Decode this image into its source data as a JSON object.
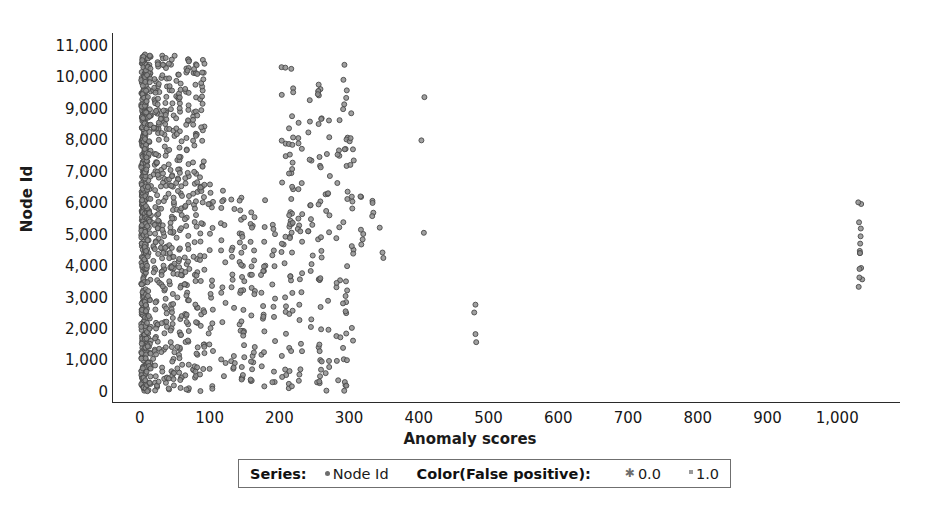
{
  "chart_data": {
    "type": "scatter",
    "title": "",
    "xlabel": "Anomaly scores",
    "ylabel": "Node Id",
    "xlim": [
      -40,
      1090
    ],
    "ylim": [
      -350,
      11400
    ],
    "grid": false,
    "x_ticks": [
      0,
      100,
      200,
      300,
      400,
      500,
      600,
      700,
      800,
      900,
      1000
    ],
    "x_tick_labels": [
      "0",
      "100",
      "200",
      "300",
      "400",
      "500",
      "600",
      "700",
      "800",
      "900",
      "1,000"
    ],
    "y_ticks": [
      0,
      1000,
      2000,
      3000,
      4000,
      5000,
      6000,
      7000,
      8000,
      9000,
      10000,
      11000
    ],
    "y_tick_labels": [
      "0",
      "1,000",
      "2,000",
      "3,000",
      "4,000",
      "5,000",
      "6,000",
      "7,000",
      "8,000",
      "9,000",
      "10,000",
      "11,000"
    ],
    "marker": {
      "shape": "circle",
      "size_px": 5,
      "fill": "#8f8f8f",
      "stroke": "#4a4a4a",
      "opacity": 0.85
    },
    "series": [
      {
        "name": "Node Id",
        "color": "#6d6d6d",
        "description": "Anomaly score per node id; scores are quantized into narrow vertical bands. A dominant dense band sits at scores 0-12 covering the entire node id range, with progressively sparser bands near 25, 40, 55, 70, 85, 145, 160, 215, 255, 290, 300, 345, 405, 480 and an outlier cluster near 1030."
      }
    ],
    "bands": [
      {
        "x_center": 4,
        "weight": 430,
        "y_min": 0,
        "y_max": 10750
      },
      {
        "x_center": 10,
        "weight": 160,
        "y_min": 0,
        "y_max": 10700
      },
      {
        "x_center": 22,
        "weight": 95,
        "y_min": 0,
        "y_max": 10700
      },
      {
        "x_center": 33,
        "weight": 80,
        "y_min": 200,
        "y_max": 10700
      },
      {
        "x_center": 44,
        "weight": 75,
        "y_min": 0,
        "y_max": 10720
      },
      {
        "x_center": 55,
        "weight": 70,
        "y_min": 0,
        "y_max": 10700
      },
      {
        "x_center": 66,
        "weight": 60,
        "y_min": 0,
        "y_max": 10700
      },
      {
        "x_center": 78,
        "weight": 55,
        "y_min": 0,
        "y_max": 10680
      },
      {
        "x_center": 88,
        "weight": 48,
        "y_min": 0,
        "y_max": 10650
      },
      {
        "x_center": 100,
        "weight": 22,
        "y_min": 0,
        "y_max": 6600
      },
      {
        "x_center": 118,
        "weight": 16,
        "y_min": 0,
        "y_max": 6400
      },
      {
        "x_center": 132,
        "weight": 14,
        "y_min": 0,
        "y_max": 6200
      },
      {
        "x_center": 145,
        "weight": 34,
        "y_min": 0,
        "y_max": 6300
      },
      {
        "x_center": 160,
        "weight": 24,
        "y_min": 0,
        "y_max": 6200
      },
      {
        "x_center": 175,
        "weight": 18,
        "y_min": 0,
        "y_max": 6100
      },
      {
        "x_center": 190,
        "weight": 14,
        "y_min": 300,
        "y_max": 6000
      },
      {
        "x_center": 205,
        "weight": 20,
        "y_min": 0,
        "y_max": 10400
      },
      {
        "x_center": 215,
        "weight": 40,
        "y_min": 0,
        "y_max": 10450
      },
      {
        "x_center": 228,
        "weight": 22,
        "y_min": 0,
        "y_max": 9800
      },
      {
        "x_center": 243,
        "weight": 16,
        "y_min": 0,
        "y_max": 9400
      },
      {
        "x_center": 256,
        "weight": 34,
        "y_min": 0,
        "y_max": 10100
      },
      {
        "x_center": 268,
        "weight": 16,
        "y_min": 0,
        "y_max": 9000
      },
      {
        "x_center": 283,
        "weight": 14,
        "y_min": 0,
        "y_max": 9600
      },
      {
        "x_center": 293,
        "weight": 30,
        "y_min": 0,
        "y_max": 10500
      },
      {
        "x_center": 302,
        "weight": 14,
        "y_min": 0,
        "y_max": 9200
      },
      {
        "x_center": 318,
        "weight": 6,
        "y_min": 3400,
        "y_max": 6500
      },
      {
        "x_center": 333,
        "weight": 4,
        "y_min": 5400,
        "y_max": 6100
      },
      {
        "x_center": 345,
        "weight": 3,
        "y_min": 3900,
        "y_max": 5600
      },
      {
        "x_center": 405,
        "weight": 3,
        "y_min": 4600,
        "y_max": 10100
      },
      {
        "x_center": 478,
        "weight": 4,
        "y_min": 1500,
        "y_max": 3000
      },
      {
        "x_center": 1032,
        "weight": 14,
        "y_min": 3200,
        "y_max": 6300
      }
    ]
  },
  "legend": {
    "series_title": "Series:",
    "series_entry": "Node Id",
    "color_title": "Color(False positive):",
    "color_entries": [
      "0.0",
      "1.0"
    ],
    "marker_series": "dot-marker-icon",
    "marker_false_positive_0": "star-marker-icon",
    "marker_false_positive_1": "square-marker-icon"
  },
  "colors": {
    "marker_fill": "#8f8f8f",
    "marker_stroke": "#4a4a4a",
    "axis": "#2a2a2a",
    "text": "#161616",
    "legend_border": "#6f6f6f",
    "background": "#ffffff"
  }
}
